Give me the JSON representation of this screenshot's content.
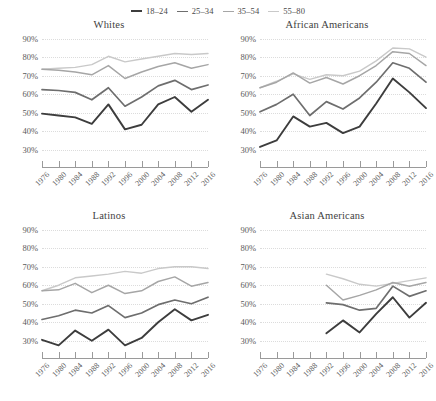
{
  "legend": {
    "position": "top-center",
    "entries": [
      {
        "label": "18–24",
        "color": "#3d3d3d",
        "width": 2.0
      },
      {
        "label": "25–34",
        "color": "#6e6e6e",
        "width": 1.8
      },
      {
        "label": "35–54",
        "color": "#a6a6a6",
        "width": 1.5
      },
      {
        "label": "55–80",
        "color": "#c9c9c9",
        "width": 1.4
      }
    ]
  },
  "axis": {
    "y_ticks": [
      "30%",
      "40%",
      "50%",
      "60%",
      "70%",
      "80%",
      "90%"
    ],
    "y_values": [
      30,
      40,
      50,
      60,
      70,
      80,
      90
    ],
    "x_ticks": [
      "1976",
      "1980",
      "1984",
      "1988",
      "1992",
      "1996",
      "2000",
      "2004",
      "2008",
      "2012",
      "2016"
    ]
  },
  "chart_data": {
    "type": "line",
    "title": "",
    "xlabel": "",
    "ylabel": "",
    "ylim": [
      25,
      92
    ],
    "xlim": [
      1976,
      2016
    ],
    "grid": true,
    "legend_position": "top-center",
    "x": [
      1976,
      1980,
      1984,
      1988,
      1992,
      1996,
      2000,
      2004,
      2008,
      2012,
      2016
    ],
    "panels": [
      {
        "title": "Whites",
        "series": [
          {
            "name": "18–24",
            "color": "#3d3d3d",
            "values": [
              49.5,
              48.5,
              47.5,
              44.0,
              54.5,
              41.0,
              43.5,
              54.5,
              58.5,
              50.5,
              57.0
            ]
          },
          {
            "name": "25–34",
            "color": "#6e6e6e",
            "values": [
              62.5,
              62.0,
              61.0,
              57.0,
              63.5,
              53.5,
              58.5,
              64.5,
              67.5,
              62.5,
              65.0
            ]
          },
          {
            "name": "35–54",
            "color": "#a6a6a6",
            "values": [
              73.5,
              73.0,
              72.0,
              70.5,
              75.5,
              68.5,
              72.0,
              75.0,
              77.0,
              74.0,
              76.0
            ]
          },
          {
            "name": "55–80",
            "color": "#c9c9c9",
            "values": [
              73.5,
              74.0,
              74.5,
              76.0,
              80.5,
              77.5,
              79.0,
              80.5,
              82.0,
              81.5,
              82.0
            ]
          }
        ]
      },
      {
        "title": "African Americans",
        "series": [
          {
            "name": "18–24",
            "color": "#3d3d3d",
            "values": [
              31.5,
              35.0,
              48.0,
              42.5,
              44.5,
              39.0,
              42.5,
              55.0,
              68.5,
              61.0,
              52.5
            ]
          },
          {
            "name": "25–34",
            "color": "#6e6e6e",
            "values": [
              50.5,
              54.5,
              60.0,
              48.5,
              56.0,
              52.0,
              58.0,
              66.5,
              77.0,
              74.0,
              66.5
            ]
          },
          {
            "name": "35–54",
            "color": "#a6a6a6",
            "values": [
              63.5,
              66.5,
              71.5,
              66.0,
              69.0,
              65.5,
              70.0,
              75.5,
              83.0,
              82.0,
              75.5
            ]
          },
          {
            "name": "55–80",
            "color": "#c9c9c9",
            "values": [
              63.5,
              67.0,
              71.0,
              68.0,
              70.5,
              70.0,
              72.5,
              78.0,
              85.0,
              84.5,
              80.0
            ]
          }
        ]
      },
      {
        "title": "Latinos",
        "series": [
          {
            "name": "18–24",
            "color": "#3d3d3d",
            "values": [
              30.5,
              27.5,
              35.5,
              30.0,
              36.0,
              27.5,
              31.5,
              40.0,
              47.0,
              41.0,
              44.0
            ]
          },
          {
            "name": "25–34",
            "color": "#6e6e6e",
            "values": [
              41.5,
              43.5,
              46.5,
              45.0,
              49.0,
              42.5,
              45.0,
              49.5,
              52.0,
              50.0,
              53.5
            ]
          },
          {
            "name": "35–54",
            "color": "#a6a6a6",
            "values": [
              57.0,
              57.5,
              61.0,
              56.0,
              60.0,
              55.5,
              57.0,
              62.0,
              64.5,
              59.5,
              61.5
            ]
          },
          {
            "name": "55–80",
            "color": "#c9c9c9",
            "values": [
              57.0,
              60.0,
              64.0,
              65.0,
              66.0,
              67.5,
              66.5,
              69.0,
              70.0,
              70.0,
              69.0
            ]
          }
        ]
      },
      {
        "title": "Asian Americans",
        "series": [
          {
            "name": "18–24",
            "color": "#3d3d3d",
            "values": [
              null,
              null,
              null,
              null,
              34.0,
              41.0,
              34.5,
              44.5,
              53.5,
              42.5,
              50.5
            ]
          },
          {
            "name": "25–34",
            "color": "#6e6e6e",
            "values": [
              null,
              null,
              null,
              null,
              50.5,
              49.5,
              46.5,
              47.5,
              59.5,
              54.0,
              57.0
            ]
          },
          {
            "name": "35–54",
            "color": "#a6a6a6",
            "values": [
              null,
              null,
              null,
              null,
              60.0,
              52.0,
              54.5,
              57.5,
              61.5,
              59.5,
              61.5
            ]
          },
          {
            "name": "55–80",
            "color": "#c9c9c9",
            "values": [
              null,
              null,
              null,
              null,
              66.0,
              63.5,
              60.5,
              59.5,
              61.0,
              62.5,
              64.0
            ]
          }
        ]
      }
    ]
  }
}
